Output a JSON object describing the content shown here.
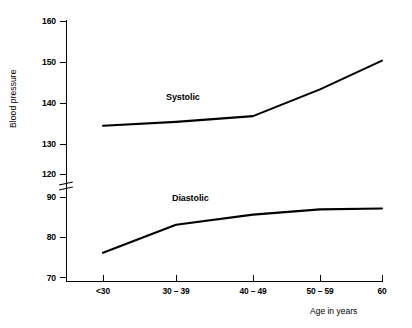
{
  "chart_data": {
    "type": "line",
    "title": "",
    "xlabel": "Age in years",
    "ylabel": "Blood pressure",
    "categories": [
      "<30",
      "30 – 39",
      "40 – 49",
      "50 – 59",
      "60"
    ],
    "series": [
      {
        "name": "Systolic",
        "values": [
          132.5,
          133.5,
          135,
          142,
          149.5
        ]
      },
      {
        "name": "Diastolic",
        "values": [
          76,
          83,
          85.5,
          86.8,
          87
        ]
      }
    ],
    "y_ticks_upper": [
      120,
      130,
      140,
      150,
      160
    ],
    "y_ticks_lower": [
      70,
      80,
      90
    ],
    "ylim_upper": [
      120,
      160
    ],
    "ylim_lower": [
      68,
      90
    ],
    "axis_break": true,
    "axis_break_between": [
      90,
      120
    ],
    "grid": false,
    "legend": "inline-labels",
    "line_color": "#000000"
  },
  "axis": {
    "y_title": "Blood pressure",
    "x_title": "Age in years",
    "y_tick_labels": [
      "160",
      "150",
      "140",
      "130",
      "120",
      "90",
      "80",
      "70"
    ],
    "x_tick_labels": [
      "<30",
      "30 – 39",
      "40 – 49",
      "50 – 59",
      "60"
    ]
  },
  "annotations": {
    "systolic_label": "Systolic",
    "diastolic_label": "Diastolic"
  }
}
